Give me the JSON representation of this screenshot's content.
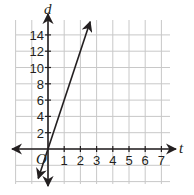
{
  "chart_data": {
    "type": "line",
    "title": "",
    "xlabel": "t",
    "ylabel": "d",
    "origin_label": "O",
    "xlim": [
      -2,
      7.8
    ],
    "ylim": [
      -4.5,
      16
    ],
    "grid": true,
    "x_ticks": [
      1,
      2,
      3,
      4,
      5,
      6,
      7
    ],
    "y_ticks": [
      2,
      4,
      6,
      8,
      10,
      12,
      14
    ],
    "x_tick_labels": [
      "1",
      "2",
      "3",
      "4",
      "5",
      "6",
      "7"
    ],
    "y_tick_labels": [
      "2",
      "4",
      "6",
      "8",
      "10",
      "12",
      "14"
    ],
    "series": [
      {
        "name": "d = 6t",
        "equation": "d = 6t",
        "slope": 6,
        "intercept": 0,
        "x": [
          -0.6,
          0,
          1,
          2,
          2.6
        ],
        "y": [
          -3.6,
          0,
          6,
          12,
          15.6
        ],
        "arrows_both_ends": true,
        "color": "#231f20"
      }
    ],
    "legend": null
  },
  "colors": {
    "axis": "#231f20",
    "grid": "#c8c8c8",
    "line": "#231f20",
    "background": "#ffffff"
  }
}
